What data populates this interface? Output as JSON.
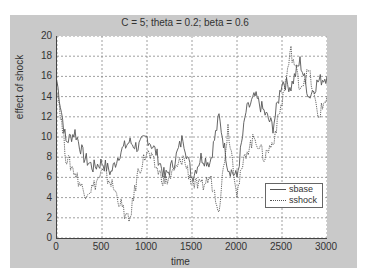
{
  "chart_data": {
    "type": "line",
    "title": "C = 5; theta = 0.2; beta = 0.6",
    "xlabel": "time",
    "ylabel": "effect of shock",
    "xlim": [
      0,
      3000
    ],
    "ylim": [
      0,
      20
    ],
    "xticks": [
      0,
      500,
      1000,
      1500,
      2000,
      2500,
      3000
    ],
    "yticks": [
      0,
      2,
      4,
      6,
      8,
      10,
      12,
      14,
      16,
      18,
      20
    ],
    "grid": true,
    "legend_position": "lower right",
    "x": [
      0,
      100,
      200,
      300,
      400,
      500,
      600,
      700,
      800,
      900,
      1000,
      1100,
      1200,
      1300,
      1400,
      1500,
      1600,
      1700,
      1800,
      1900,
      2000,
      2100,
      2200,
      2300,
      2400,
      2500,
      2600,
      2700,
      2800,
      2900,
      3000
    ],
    "series": [
      {
        "name": "sbase",
        "style": "solid",
        "values": [
          15.5,
          9.5,
          10.5,
          8.0,
          7.0,
          7.5,
          6.5,
          8.5,
          9.5,
          9.0,
          10.0,
          8.5,
          6.0,
          7.5,
          10.0,
          6.0,
          8.0,
          7.5,
          12.0,
          7.0,
          6.0,
          12.5,
          14.0,
          12.5,
          11.0,
          15.5,
          15.0,
          17.5,
          14.0,
          15.5,
          16.0
        ]
      },
      {
        "name": "sshock",
        "style": "dotted",
        "values": [
          15.0,
          8.0,
          6.5,
          4.5,
          5.0,
          6.5,
          5.5,
          3.5,
          1.5,
          6.5,
          8.5,
          7.0,
          5.5,
          6.5,
          8.0,
          5.5,
          5.0,
          6.0,
          3.0,
          11.0,
          4.5,
          8.5,
          10.0,
          8.0,
          9.5,
          13.5,
          18.5,
          15.0,
          16.5,
          12.0,
          14.0
        ]
      }
    ]
  }
}
